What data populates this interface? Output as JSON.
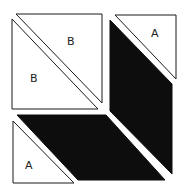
{
  "diagram": {
    "colors": {
      "light_fill": "#ffffff",
      "dark_fill": "#0d0d0d",
      "outline": "#1a1a1a"
    },
    "pieces": [
      {
        "id": "b-upper",
        "type": "triangle",
        "fill": "light",
        "label": "B"
      },
      {
        "id": "b-lower",
        "type": "triangle",
        "fill": "light",
        "label": "B"
      },
      {
        "id": "a-top-right",
        "type": "triangle",
        "fill": "light",
        "label": "A"
      },
      {
        "id": "a-bottom-left",
        "type": "triangle",
        "fill": "light",
        "label": "A"
      },
      {
        "id": "dark-vertical",
        "type": "parallelogram",
        "fill": "dark",
        "label": ""
      },
      {
        "id": "dark-horizontal",
        "type": "parallelogram",
        "fill": "dark",
        "label": ""
      }
    ],
    "labels": {
      "b_upper": "B",
      "b_lower": "B",
      "a_top_right": "A",
      "a_bottom_left": "A"
    }
  }
}
